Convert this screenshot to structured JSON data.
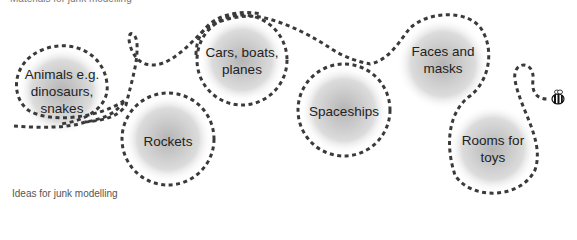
{
  "captions": {
    "top": "Materials for junk modelling",
    "bottom": "Ideas for junk modelling"
  },
  "bubbles": [
    {
      "id": "animals",
      "lines": [
        "Animals e.g.",
        "dinosaurs,",
        "snakes"
      ],
      "cx": 62,
      "cy": 91,
      "r": 46
    },
    {
      "id": "rockets",
      "lines": [
        "Rockets"
      ],
      "cx": 168,
      "cy": 139,
      "r": 46
    },
    {
      "id": "cars",
      "lines": [
        "Cars, boats,",
        "planes"
      ],
      "cx": 242,
      "cy": 60,
      "r": 45
    },
    {
      "id": "spaceships",
      "lines": [
        "Spaceships"
      ],
      "cx": 344,
      "cy": 110,
      "r": 46
    },
    {
      "id": "faces",
      "lines": [
        "Faces and",
        "masks"
      ],
      "cx": 443,
      "cy": 64,
      "r": 46
    },
    {
      "id": "rooms",
      "lines": [
        "Rooms for",
        "toys"
      ],
      "cx": 493,
      "cy": 149,
      "r": 46
    }
  ],
  "colors": {
    "dash": "#3a3a3a",
    "bubble_center": "#b8b8b8",
    "bubble_edge": "#ffffff",
    "text": "#222222"
  },
  "icons": {
    "end_marker": "bee-icon"
  }
}
